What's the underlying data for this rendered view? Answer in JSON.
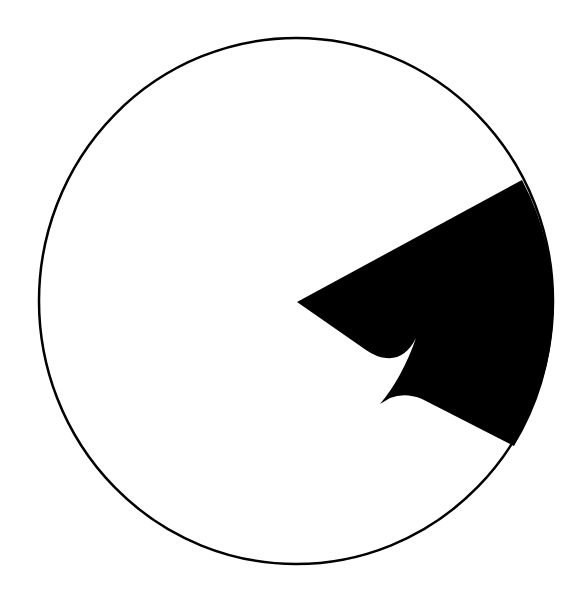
{
  "figure": {
    "background_color": "#ffffff",
    "circle": {
      "cx": 296,
      "cy": 301,
      "rx": 257,
      "ry": 263,
      "stroke_color": "#000000",
      "stroke_width": 2.5,
      "fill": "#ffffff"
    },
    "wedge": {
      "fill_color": "#000000",
      "tip": [
        297,
        302
      ],
      "upper_corner": [
        522,
        180
      ],
      "lower_corner": [
        514,
        446
      ],
      "notch_spike": [
        416,
        338
      ],
      "notch_lower_point": [
        380,
        404
      ]
    }
  }
}
